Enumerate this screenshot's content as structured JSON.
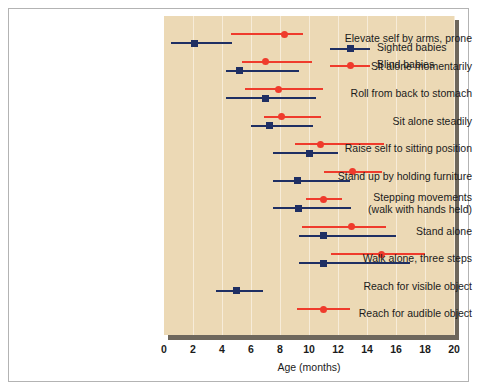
{
  "figure": {
    "axis_title": "Age (months)"
  },
  "legend": {
    "entries": [
      {
        "label": "Sighted babies",
        "icon": "square-marker-icon",
        "color": "#1f2f63"
      },
      {
        "label": "Blind babies",
        "icon": "circle-marker-icon",
        "color": "#ef3b2c"
      }
    ]
  },
  "chart_data": {
    "type": "range",
    "title": "",
    "subtitle": "",
    "xlabel": "Age (months)",
    "ylabel": "",
    "xlim": [
      0,
      20
    ],
    "xticks": [
      0,
      2,
      4,
      6,
      8,
      10,
      12,
      14,
      16,
      18,
      20
    ],
    "grid": true,
    "legend_position": "top-right",
    "plot_background": "#ecd9b5",
    "categories": [
      "Elevate self by arms, prone",
      "Sit alone momentarily",
      "Roll from back to stomach",
      "Sit alone steadily",
      "Raise self to sitting position",
      "Stand up by holding furniture",
      "Stepping movements\n(walk with hands held)",
      "Stand alone",
      "Walk alone, three steps",
      "Reach for visible object",
      "Reach for audible object"
    ],
    "series": [
      {
        "name": "Sighted babies",
        "color": "#1f2f63",
        "marker": "square",
        "points": [
          {
            "category": "Elevate self by arms, prone",
            "low": 0.5,
            "median": 2.1,
            "high": 4.7
          },
          {
            "category": "Sit alone momentarily",
            "low": 4.3,
            "median": 5.2,
            "high": 9.3
          },
          {
            "category": "Roll from back to stomach",
            "low": 4.3,
            "median": 7.0,
            "high": 10.5
          },
          {
            "category": "Sit alone steadily",
            "low": 6.0,
            "median": 7.3,
            "high": 10.3
          },
          {
            "category": "Raise self to sitting position",
            "low": 7.5,
            "median": 10.0,
            "high": 12.0
          },
          {
            "category": "Stand up by holding furniture",
            "low": 7.5,
            "median": 9.2,
            "high": 12.8
          },
          {
            "category": "Stepping movements\n(walk with hands held)",
            "low": 7.5,
            "median": 9.3,
            "high": 12.9
          },
          {
            "category": "Stand alone",
            "low": 9.3,
            "median": 11.0,
            "high": 16.0
          },
          {
            "category": "Walk alone, three steps",
            "low": 9.3,
            "median": 11.0,
            "high": 17.0
          },
          {
            "category": "Reach for visible object",
            "low": 3.6,
            "median": 5.0,
            "high": 6.8
          }
        ]
      },
      {
        "name": "Blind babies",
        "color": "#ef3b2c",
        "marker": "circle",
        "points": [
          {
            "category": "Elevate self by arms, prone",
            "low": 4.6,
            "median": 8.3,
            "high": 9.6
          },
          {
            "category": "Sit alone momentarily",
            "low": 5.4,
            "median": 7.0,
            "high": 10.2
          },
          {
            "category": "Roll from back to stomach",
            "low": 5.6,
            "median": 7.9,
            "high": 11.0
          },
          {
            "category": "Sit alone steadily",
            "low": 6.9,
            "median": 8.1,
            "high": 10.8
          },
          {
            "category": "Raise self to sitting position",
            "low": 9.0,
            "median": 10.8,
            "high": 15.2
          },
          {
            "category": "Stand up by holding furniture",
            "low": 11.0,
            "median": 13.0,
            "high": 15.0
          },
          {
            "category": "Stepping movements\n(walk with hands held)",
            "low": 9.8,
            "median": 11.0,
            "high": 12.3
          },
          {
            "category": "Stand alone",
            "low": 9.5,
            "median": 12.9,
            "high": 15.3
          },
          {
            "category": "Walk alone, three steps",
            "low": 11.5,
            "median": 15.0,
            "high": 18.0
          },
          {
            "category": "Reach for audible object",
            "low": 9.2,
            "median": 11.0,
            "high": 12.8
          }
        ]
      }
    ]
  }
}
